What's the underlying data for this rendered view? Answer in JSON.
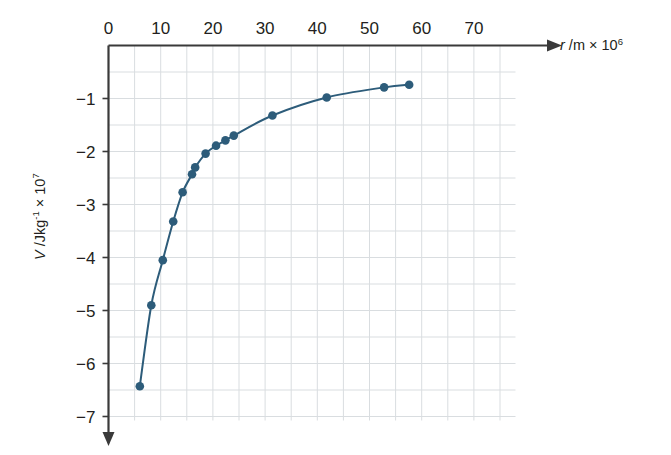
{
  "figure": {
    "name": "gravitational-potential-vs-radius-graph",
    "background_color": "#ffffff",
    "grid_color": "#d9dde0",
    "axis_color": "#3a3a3a",
    "series_color": "#2d5c7a"
  },
  "axes": {
    "x": {
      "label_parts": {
        "symbol": "r",
        "unit": " /m × 10",
        "exponent": "6"
      },
      "label_text": "r /m × 10⁶",
      "ticks": [
        0,
        10,
        20,
        30,
        40,
        50,
        60,
        70
      ],
      "tick_labels": [
        "0",
        "10",
        "20",
        "30",
        "40",
        "50",
        "60",
        "70"
      ],
      "minor_step": 5,
      "range": [
        0,
        80
      ],
      "arrow": true
    },
    "y": {
      "label_parts": {
        "symbol": "V",
        "unit": " /Jkg",
        "exp1": "-1",
        "mid": " × 10",
        "exp2": "7"
      },
      "label_text": "V / Jkg⁻¹ × 10⁷",
      "ticks": [
        -1,
        -2,
        -3,
        -4,
        -5,
        -6,
        -7
      ],
      "tick_labels": [
        "−1",
        "−2",
        "−3",
        "−4",
        "−5",
        "−6",
        "−7"
      ],
      "minor_step": 0.5,
      "range": [
        -7,
        0
      ],
      "arrow": true
    }
  },
  "chart_data": {
    "type": "line",
    "title": "",
    "xlabel": "r /m × 10⁶",
    "ylabel": "V / Jkg⁻¹ × 10⁷",
    "xlim": [
      0,
      80
    ],
    "ylim": [
      -7,
      0
    ],
    "grid": true,
    "legend": "none",
    "markers": true,
    "series": [
      {
        "name": "gravitational potential",
        "color": "#2d5c7a",
        "x": [
          6.0,
          8.2,
          10.4,
          12.4,
          14.2,
          16.0,
          16.6,
          18.6,
          20.6,
          22.4,
          24.0,
          31.4,
          41.8,
          52.8,
          57.6
        ],
        "y": [
          -6.43,
          -4.9,
          -4.05,
          -3.32,
          -2.77,
          -2.43,
          -2.3,
          -2.04,
          -1.89,
          -1.79,
          -1.7,
          -1.32,
          -0.98,
          -0.79,
          -0.74
        ]
      }
    ]
  }
}
